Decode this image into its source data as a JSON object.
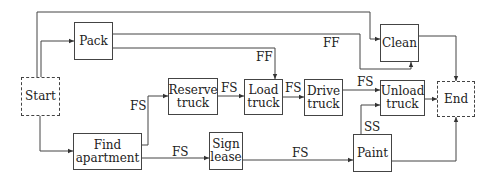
{
  "nodes": {
    "start": {
      "label": "Start"
    },
    "pack": {
      "label": "Pack"
    },
    "clean": {
      "label": "Clean"
    },
    "find_apartment": {
      "label": "Find apartment"
    },
    "reserve_truck": {
      "label": "Reserve truck"
    },
    "load_truck": {
      "label": "Load truck"
    },
    "drive_truck": {
      "label": "Drive truck"
    },
    "unload_truck": {
      "label": "Unload truck"
    },
    "sign_lease": {
      "label": "Sign lease"
    },
    "paint": {
      "label": "Paint"
    },
    "end": {
      "label": "End"
    }
  },
  "edges": [
    {
      "from": "start",
      "to": "clean",
      "label": ""
    },
    {
      "from": "start",
      "to": "pack",
      "label": ""
    },
    {
      "from": "start",
      "to": "find_apartment",
      "label": ""
    },
    {
      "from": "pack",
      "to": "clean",
      "label": "FF"
    },
    {
      "from": "pack",
      "to": "load_truck",
      "label": "FF"
    },
    {
      "from": "find_apartment",
      "to": "reserve_truck",
      "label": "FS"
    },
    {
      "from": "find_apartment",
      "to": "sign_lease",
      "label": "FS"
    },
    {
      "from": "reserve_truck",
      "to": "load_truck",
      "label": "FS"
    },
    {
      "from": "load_truck",
      "to": "drive_truck",
      "label": "FS"
    },
    {
      "from": "drive_truck",
      "to": "unload_truck",
      "label": "FS"
    },
    {
      "from": "sign_lease",
      "to": "paint",
      "label": "FS"
    },
    {
      "from": "paint",
      "to": "unload_truck",
      "label": "SS"
    },
    {
      "from": "clean",
      "to": "end",
      "label": ""
    },
    {
      "from": "unload_truck",
      "to": "end",
      "label": ""
    },
    {
      "from": "paint",
      "to": "end",
      "label": ""
    }
  ],
  "edge_labels": {
    "pack_clean": "FF",
    "pack_load": "FF",
    "find_reserve": "FS",
    "find_sign": "FS",
    "reserve_load": "FS",
    "load_drive": "FS",
    "drive_unload": "FS",
    "sign_paint": "FS",
    "paint_unload": "SS"
  }
}
